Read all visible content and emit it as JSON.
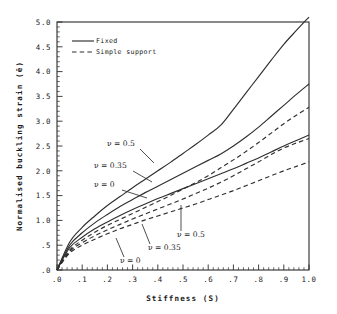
{
  "chart_data": {
    "type": "line",
    "title": "",
    "xlabel": "Stiffness (S)",
    "ylabel": "Normalised buckling strain (ē)",
    "xlim": [
      0.0,
      1.0
    ],
    "ylim": [
      0.0,
      5.0
    ],
    "grid": false,
    "legend_position": "top-left",
    "xticklabels": [
      ".0",
      ".1",
      ".2",
      ".3",
      ".4",
      ".5",
      ".6",
      ".7",
      ".8",
      ".9",
      "1.0"
    ],
    "xtickvalues": [
      0.0,
      0.1,
      0.2,
      0.3,
      0.4,
      0.5,
      0.6,
      0.7,
      0.8,
      0.9,
      1.0
    ],
    "yticklabels": [
      ".0",
      ".5",
      "1.0",
      "1.5",
      "2.0",
      "2.5",
      "3.0",
      "3.5",
      "4.0",
      "4.5",
      "5.0"
    ],
    "ytickvalues": [
      0.0,
      0.5,
      1.0,
      1.5,
      2.0,
      2.5,
      3.0,
      3.5,
      4.0,
      4.5,
      5.0
    ],
    "x": [
      0.0,
      0.05,
      0.1,
      0.15,
      0.2,
      0.25,
      0.3,
      0.35,
      0.4,
      0.45,
      0.5,
      0.55,
      0.6,
      0.65,
      0.7,
      0.75,
      0.8,
      0.85,
      0.9,
      0.95,
      1.0
    ],
    "series": [
      {
        "name": "Fixed, ν = 0.5",
        "style": "solid",
        "nu": 0.5,
        "support": "Fixed",
        "values": [
          0.0,
          0.56,
          0.86,
          1.09,
          1.3,
          1.48,
          1.66,
          1.83,
          2.0,
          2.17,
          2.35,
          2.53,
          2.72,
          2.92,
          3.24,
          3.57,
          3.9,
          4.23,
          4.55,
          4.83,
          5.1
        ]
      },
      {
        "name": "Fixed, ν = 0.35",
        "style": "solid",
        "nu": 0.35,
        "support": "Fixed",
        "values": [
          0.0,
          0.5,
          0.75,
          0.95,
          1.12,
          1.28,
          1.42,
          1.56,
          1.69,
          1.82,
          1.95,
          2.08,
          2.21,
          2.34,
          2.5,
          2.68,
          2.88,
          3.1,
          3.32,
          3.54,
          3.75
        ]
      },
      {
        "name": "Fixed, ν = 0",
        "style": "solid",
        "nu": 0,
        "support": "Fixed",
        "values": [
          0.0,
          0.45,
          0.66,
          0.83,
          0.97,
          1.1,
          1.22,
          1.33,
          1.44,
          1.54,
          1.64,
          1.74,
          1.84,
          1.94,
          2.04,
          2.15,
          2.26,
          2.38,
          2.5,
          2.61,
          2.72
        ]
      },
      {
        "name": "Simple support, ν = 0.5",
        "style": "dashed",
        "nu": 0.5,
        "support": "Simple support",
        "values": [
          0.0,
          0.4,
          0.6,
          0.76,
          0.9,
          1.02,
          1.14,
          1.26,
          1.38,
          1.5,
          1.63,
          1.76,
          1.9,
          2.06,
          2.22,
          2.39,
          2.57,
          2.76,
          2.95,
          3.12,
          3.28
        ]
      },
      {
        "name": "Simple support, ν = 0.35",
        "style": "dashed",
        "nu": 0.35,
        "support": "Simple support",
        "values": [
          0.0,
          0.37,
          0.55,
          0.69,
          0.81,
          0.92,
          1.03,
          1.13,
          1.23,
          1.33,
          1.43,
          1.54,
          1.65,
          1.77,
          1.9,
          2.04,
          2.18,
          2.33,
          2.46,
          2.56,
          2.65
        ]
      },
      {
        "name": "Simple support, ν = 0",
        "style": "dashed",
        "nu": 0,
        "support": "Simple support",
        "values": [
          0.0,
          0.34,
          0.5,
          0.62,
          0.73,
          0.83,
          0.92,
          1.01,
          1.09,
          1.17,
          1.25,
          1.33,
          1.42,
          1.51,
          1.6,
          1.7,
          1.8,
          1.9,
          2.0,
          2.09,
          2.18
        ]
      }
    ],
    "legend": [
      {
        "label": "Fixed",
        "style": "solid"
      },
      {
        "label": "Simple support",
        "style": "dashed"
      }
    ],
    "annotations": [
      {
        "text": "ν = 0.5",
        "group": "fixed"
      },
      {
        "text": "ν = 0.35",
        "group": "fixed"
      },
      {
        "text": "ν = 0",
        "group": "fixed"
      },
      {
        "text": "ν = 0.5",
        "group": "simple"
      },
      {
        "text": "ν = 0.35",
        "group": "simple"
      },
      {
        "text": "ν = 0",
        "group": "simple"
      }
    ]
  }
}
